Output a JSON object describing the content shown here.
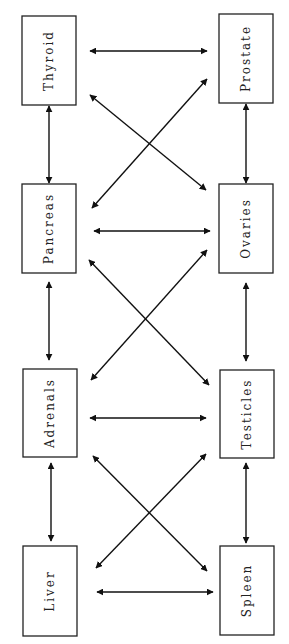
{
  "diagram": {
    "type": "node-link",
    "nodes": [
      {
        "id": "thyroid",
        "label": "Thyroid",
        "x": 22,
        "y": 16,
        "w": 54,
        "h": 89
      },
      {
        "id": "prostate",
        "label": "Prostate",
        "x": 219,
        "y": 14,
        "w": 54,
        "h": 89
      },
      {
        "id": "pancreas",
        "label": "Pancreas",
        "x": 22,
        "y": 184,
        "w": 54,
        "h": 89
      },
      {
        "id": "ovaries",
        "label": "Ovaries",
        "x": 219,
        "y": 184,
        "w": 54,
        "h": 89
      },
      {
        "id": "adrenals",
        "label": "Adrenals",
        "x": 23,
        "y": 369,
        "w": 54,
        "h": 88
      },
      {
        "id": "testicles",
        "label": "Testicles",
        "x": 220,
        "y": 370,
        "w": 54,
        "h": 88
      },
      {
        "id": "liver",
        "label": "Liver",
        "x": 23,
        "y": 546,
        "w": 54,
        "h": 90
      },
      {
        "id": "spleen",
        "label": "Spleen",
        "x": 220,
        "y": 546,
        "w": 54,
        "h": 89
      }
    ],
    "edges": [
      {
        "from": "thyroid",
        "to": "prostate",
        "x1": 90,
        "y1": 51,
        "x2": 207,
        "y2": 51
      },
      {
        "from": "thyroid",
        "to": "ovaries",
        "x1": 90,
        "y1": 95,
        "x2": 206,
        "y2": 190
      },
      {
        "from": "prostate",
        "to": "pancreas",
        "x1": 207,
        "y1": 79,
        "x2": 92,
        "y2": 208
      },
      {
        "from": "thyroid",
        "to": "pancreas",
        "x1": 49,
        "y1": 106,
        "x2": 49,
        "y2": 183
      },
      {
        "from": "prostate",
        "to": "ovaries",
        "x1": 246,
        "y1": 104,
        "x2": 246,
        "y2": 183
      },
      {
        "from": "pancreas",
        "to": "ovaries",
        "x1": 94,
        "y1": 231,
        "x2": 210,
        "y2": 231
      },
      {
        "from": "pancreas",
        "to": "testicles",
        "x1": 89,
        "y1": 260,
        "x2": 209,
        "y2": 385
      },
      {
        "from": "ovaries",
        "to": "adrenals",
        "x1": 207,
        "y1": 250,
        "x2": 91,
        "y2": 380
      },
      {
        "from": "pancreas",
        "to": "adrenals",
        "x1": 49,
        "y1": 282,
        "x2": 49,
        "y2": 360
      },
      {
        "from": "ovaries",
        "to": "testicles",
        "x1": 246,
        "y1": 283,
        "x2": 246,
        "y2": 361
      },
      {
        "from": "adrenals",
        "to": "testicles",
        "x1": 90,
        "y1": 418,
        "x2": 206,
        "y2": 418
      },
      {
        "from": "adrenals",
        "to": "spleen",
        "x1": 93,
        "y1": 456,
        "x2": 207,
        "y2": 571
      },
      {
        "from": "testicles",
        "to": "liver",
        "x1": 206,
        "y1": 454,
        "x2": 96,
        "y2": 568
      },
      {
        "from": "adrenals",
        "to": "liver",
        "x1": 51,
        "y1": 463,
        "x2": 51,
        "y2": 541
      },
      {
        "from": "testicles",
        "to": "spleen",
        "x1": 246,
        "y1": 463,
        "x2": 246,
        "y2": 543
      },
      {
        "from": "liver",
        "to": "spleen",
        "x1": 97,
        "y1": 592,
        "x2": 213,
        "y2": 592
      }
    ],
    "edge_style": "bidirectional-arrow",
    "colors": {
      "stroke": "#111111",
      "box_fill": "#ffffff",
      "text": "#222222"
    }
  }
}
